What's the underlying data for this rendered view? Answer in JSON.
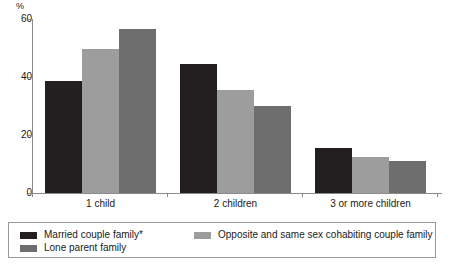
{
  "chart_data": {
    "type": "bar",
    "title": "",
    "xlabel": "",
    "ylabel": "%",
    "ylim": [
      0,
      60
    ],
    "yticks": [
      0,
      20,
      40,
      60
    ],
    "grid": false,
    "legend_position": "bottom",
    "categories": [
      "1 child",
      "2 children",
      "3 or more children"
    ],
    "series": [
      {
        "name": "Married couple family*",
        "color": "#231f20",
        "values": [
          38.5,
          44.5,
          15.5
        ]
      },
      {
        "name": "Opposite and same sex cohabiting couple family",
        "color": "#9d9d9d",
        "values": [
          49.5,
          35.5,
          12.5
        ]
      },
      {
        "name": "Lone parent family",
        "color": "#6e6e6e",
        "values": [
          56.5,
          30.0,
          11.0
        ]
      }
    ]
  },
  "axis": {
    "unit_label": "%",
    "tick_0": "0",
    "tick_1": "20",
    "tick_2": "40",
    "tick_3": "60"
  }
}
